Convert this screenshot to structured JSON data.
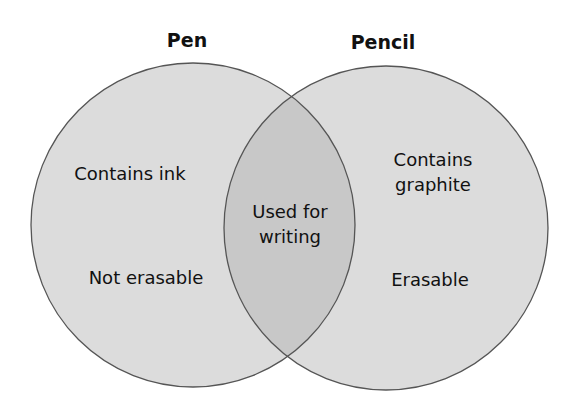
{
  "diagram": {
    "type": "venn",
    "sets": [
      {
        "name": "Pen",
        "items": [
          "Contains ink",
          "Not erasable"
        ]
      },
      {
        "name": "Pencil",
        "items": [
          "Contains graphite",
          "Erasable"
        ]
      }
    ],
    "left": {
      "title": "Pen",
      "item1": "Contains ink",
      "item2": "Not erasable"
    },
    "right": {
      "title": "Pencil",
      "item1_line1": "Contains",
      "item1_line2": "graphite",
      "item2": "Erasable"
    },
    "overlap": {
      "line1": "Used for",
      "line2": "writing"
    },
    "colors": {
      "circle_fill": "#dcdcdc",
      "overlap_fill": "#c6c6c6",
      "stroke": "#555555"
    }
  }
}
